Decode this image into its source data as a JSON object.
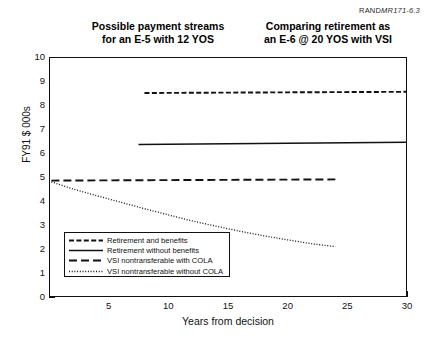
{
  "figure_id": {
    "prefix": "RAND",
    "suffix": "MR171-6.3"
  },
  "titles": {
    "left": "Possible payment streams\nfor an E-5 with 12 YOS",
    "right": "Comparing retirement as\nan E-6 @ 20 YOS with VSI"
  },
  "chart_data": {
    "type": "line",
    "xlabel": "Years from decision",
    "ylabel": "FY91 $ 000s",
    "xlim": [
      0,
      30
    ],
    "ylim": [
      0,
      10
    ],
    "xticks": [
      5,
      10,
      15,
      20,
      25,
      30
    ],
    "xticks_minor_step": 1,
    "yticks": [
      0,
      1,
      2,
      3,
      4,
      5,
      6,
      7,
      8,
      9,
      10
    ],
    "grid": false,
    "legend_position": "lower-left-inside",
    "series": [
      {
        "name": "Retirement and benefits",
        "style": "dashed",
        "points": [
          [
            8.0,
            8.5
          ],
          [
            30.0,
            8.55
          ]
        ]
      },
      {
        "name": "Retirement without benefits",
        "style": "solid",
        "points": [
          [
            7.5,
            6.35
          ],
          [
            30.0,
            6.45
          ]
        ]
      },
      {
        "name": "VSI nontransferable with COLA",
        "style": "long-dash",
        "points": [
          [
            0.2,
            4.85
          ],
          [
            24.0,
            4.9
          ]
        ]
      },
      {
        "name": "VSI nontransferable without COLA",
        "style": "dotted",
        "points": [
          [
            0.2,
            4.8
          ],
          [
            2.0,
            4.5
          ],
          [
            4.0,
            4.22
          ],
          [
            6.0,
            3.95
          ],
          [
            8.0,
            3.68
          ],
          [
            10.0,
            3.42
          ],
          [
            12.0,
            3.17
          ],
          [
            14.0,
            2.95
          ],
          [
            16.0,
            2.74
          ],
          [
            18.0,
            2.55
          ],
          [
            20.0,
            2.38
          ],
          [
            22.0,
            2.22
          ],
          [
            24.0,
            2.1
          ]
        ]
      }
    ]
  },
  "legend": {
    "items": [
      {
        "label": "Retirement and benefits",
        "style": "dashed"
      },
      {
        "label": "Retirement without benefits",
        "style": "solid"
      },
      {
        "label": "VSI nontransferable with COLA",
        "style": "long-dash"
      },
      {
        "label": "VSI nontransferable without COLA",
        "style": "dotted"
      }
    ]
  },
  "colors": {
    "ink": "#111111",
    "background": "#ffffff"
  }
}
